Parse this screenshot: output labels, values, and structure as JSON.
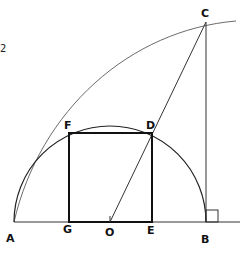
{
  "figure": {
    "points": {
      "A": {
        "label": "A",
        "x": 14,
        "y": 222
      },
      "B": {
        "label": "B",
        "x": 206,
        "y": 222
      },
      "C": {
        "label": "C",
        "x": 206,
        "y": 22
      },
      "D": {
        "label": "D",
        "x": 152,
        "y": 133
      },
      "E": {
        "label": "E",
        "x": 152,
        "y": 222
      },
      "F": {
        "label": "F",
        "x": 69,
        "y": 133
      },
      "G": {
        "label": "G",
        "x": 69,
        "y": 222
      },
      "O": {
        "label": "O",
        "x": 110,
        "y": 222
      }
    },
    "labels": {
      "A": "A",
      "B": "B",
      "C": "C",
      "D": "D",
      "E": "E",
      "F": "F",
      "G": "G",
      "O": "O"
    },
    "edge_artifact": "2",
    "colors": {
      "ink": "#111111",
      "thin_ink": "#333333",
      "background": "#ffffff"
    }
  }
}
